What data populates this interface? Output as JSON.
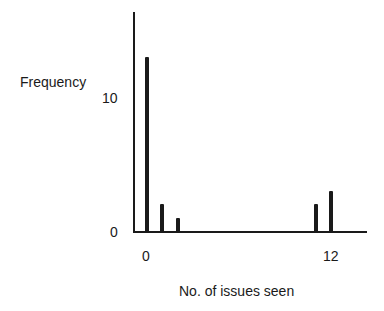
{
  "chart_data": {
    "type": "bar",
    "title": "",
    "xlabel": "No. of issues seen",
    "ylabel": "Frequency",
    "x": [
      0,
      1,
      2,
      11,
      12
    ],
    "values": [
      13,
      2,
      1,
      2,
      3
    ],
    "x_ticks": [
      "0",
      "12"
    ],
    "y_ticks": [
      "0",
      "10"
    ],
    "xlim": [
      0,
      13
    ],
    "ylim": [
      0,
      16
    ],
    "grid": false,
    "legend": null
  },
  "labels": {
    "ylabel": "Frequency",
    "xlabel": "No. of issues seen",
    "y_tick_0": "0",
    "y_tick_10": "10",
    "x_tick_0": "0",
    "x_tick_12": "12"
  }
}
